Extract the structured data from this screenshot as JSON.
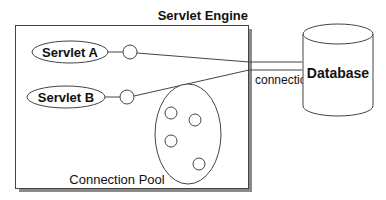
{
  "diagram": {
    "container": {
      "title": "Servlet Engine"
    },
    "servlets": [
      {
        "label": "Servlet A"
      },
      {
        "label": "Servlet B"
      }
    ],
    "pool": {
      "label": "Connection Pool",
      "connection_count": 4
    },
    "database": {
      "label": "Database"
    },
    "link_label": "connections",
    "colors": {
      "stroke": "#333333",
      "shadow": "#8a8a8a",
      "background": "#ffffff"
    }
  }
}
